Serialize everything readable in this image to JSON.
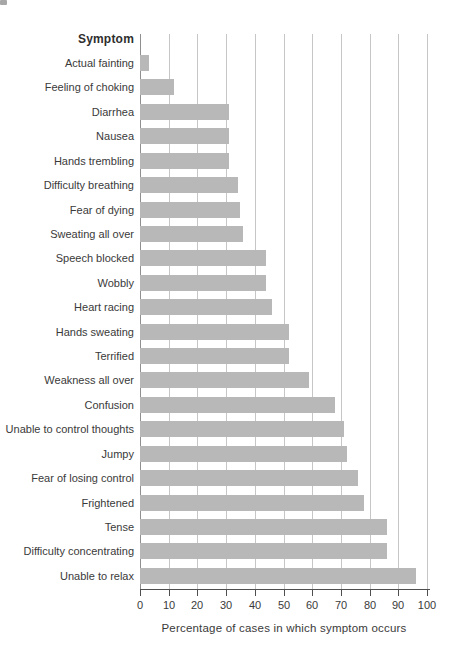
{
  "chart_data": {
    "type": "bar",
    "orientation": "horizontal",
    "title": "Symptom",
    "xlabel": "Percentage of cases in which symptom occurs",
    "categories": [
      "Actual fainting",
      "Feeling of choking",
      "Diarrhea",
      "Nausea",
      "Hands trembling",
      "Difficulty breathing",
      "Fear of dying",
      "Sweating all over",
      "Speech blocked",
      "Wobbly",
      "Heart racing",
      "Hands sweating",
      "Terrified",
      "Weakness all over",
      "Confusion",
      "Unable to control thoughts",
      "Jumpy",
      "Fear of losing control",
      "Frightened",
      "Tense",
      "Difficulty concentrating",
      "Unable to relax"
    ],
    "values": [
      3,
      12,
      31,
      31,
      31,
      34,
      35,
      36,
      44,
      44,
      46,
      52,
      52,
      59,
      68,
      71,
      72,
      76,
      78,
      86,
      86,
      96
    ],
    "xlim": [
      0,
      100
    ],
    "xticks": [
      0,
      10,
      20,
      30,
      40,
      50,
      60,
      70,
      80,
      90,
      100
    ],
    "grid": true,
    "legend": "none",
    "bar_color": "#b8b8b8",
    "gridline_color": "#c6c6c6",
    "axis_color": "#4f4f4f",
    "text_color": "#3a3a3a"
  }
}
